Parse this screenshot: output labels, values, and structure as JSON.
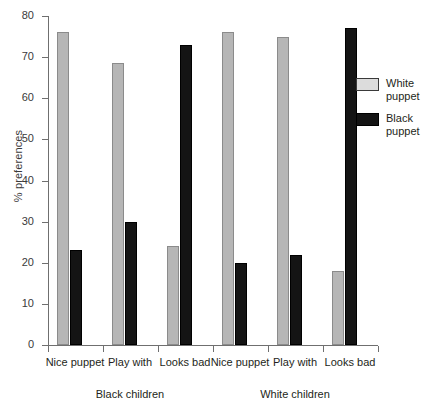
{
  "chart_data": {
    "type": "bar",
    "title": "",
    "xlabel": "",
    "ylabel": "% preferences",
    "ylim": [
      0,
      80
    ],
    "ytick_values": [
      0,
      10,
      20,
      30,
      40,
      50,
      60,
      70,
      80
    ],
    "ytick_labels": [
      "0",
      "10",
      "20",
      "30",
      "40",
      "50",
      "60",
      "70",
      "80"
    ],
    "grid": false,
    "legend_position": "right",
    "categories": [
      "Nice\npuppet",
      "Play\nwith",
      "Looks\nbad",
      "Nice\npuppet",
      "Play\nwith",
      "Looks\nbad"
    ],
    "groups": [
      {
        "label": "Black children",
        "categories": [
          "Nice\npuppet",
          "Play\nwith",
          "Looks\nbad"
        ]
      },
      {
        "label": "White children",
        "categories": [
          "Nice\npuppet",
          "Play\nwith",
          "Looks\nbad"
        ]
      }
    ],
    "series": [
      {
        "name": "White\npuppet",
        "color": "#b6b6b6",
        "values": [
          76,
          68.5,
          24,
          76,
          75,
          18
        ]
      },
      {
        "name": "Black\npuppet",
        "color": "#141414",
        "values": [
          23,
          30,
          73,
          20,
          22,
          77
        ]
      }
    ]
  },
  "axis": {
    "y_label": "% preferences",
    "ticks": [
      {
        "value": 80,
        "label": "80"
      },
      {
        "value": 70,
        "label": "70"
      },
      {
        "value": 60,
        "label": "60"
      },
      {
        "value": 50,
        "label": "50"
      },
      {
        "value": 40,
        "label": "40"
      },
      {
        "value": 30,
        "label": "30"
      },
      {
        "value": 20,
        "label": "20"
      },
      {
        "value": 10,
        "label": "10"
      },
      {
        "value": 0,
        "label": "0"
      }
    ]
  },
  "categories": [
    {
      "label": "Nice\npuppet"
    },
    {
      "label": "Play\nwith"
    },
    {
      "label": "Looks\nbad"
    },
    {
      "label": "Nice\npuppet"
    },
    {
      "label": "Play\nwith"
    },
    {
      "label": "Looks\nbad"
    }
  ],
  "groups": [
    {
      "label": "Black children"
    },
    {
      "label": "White children"
    }
  ],
  "legend": {
    "items": [
      {
        "label": "White\npuppet",
        "color": "#b6b6b6"
      },
      {
        "label": "Black\npuppet",
        "color": "#141414"
      }
    ]
  }
}
